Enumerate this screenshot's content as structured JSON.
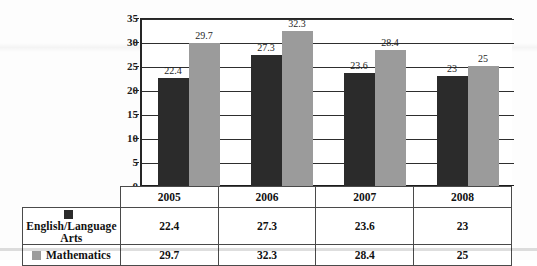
{
  "chart_data": {
    "type": "bar",
    "title": "",
    "subtitle": "",
    "xlabel": "",
    "ylabel": "",
    "categories": [
      "2005",
      "2006",
      "2007",
      "2008"
    ],
    "series": [
      {
        "name": "English/Language Arts",
        "color": "#2b2b2b",
        "values": [
          22.4,
          27.3,
          23.6,
          23
        ]
      },
      {
        "name": "Mathematics",
        "color": "#9b9b9b",
        "values": [
          29.7,
          32.3,
          28.4,
          25
        ]
      }
    ],
    "value_labels": {
      "english": [
        "22.4",
        "27.3",
        "23.6",
        "23"
      ],
      "mathematics": [
        "29.7",
        "32.3",
        "28.4",
        "25"
      ]
    },
    "ylim": [
      0,
      35
    ],
    "ytick_values": [
      0,
      5,
      10,
      15,
      20,
      25,
      30,
      35
    ],
    "ytick_labels": [
      "0",
      "5",
      "10",
      "15",
      "20",
      "25",
      "30",
      "35"
    ],
    "grid": "horizontal",
    "legend_position": "table-below",
    "annotations": []
  },
  "axis": {
    "ticks": [
      {
        "value": 35,
        "label": "35"
      },
      {
        "value": 30,
        "label": "30"
      },
      {
        "value": 25,
        "label": "25"
      },
      {
        "value": 20,
        "label": "20"
      },
      {
        "value": 15,
        "label": "15"
      },
      {
        "value": 10,
        "label": "10"
      },
      {
        "value": 5,
        "label": "5"
      },
      {
        "value": 0,
        "label": "0"
      }
    ]
  },
  "table": {
    "corner_label": "",
    "year_headers": [
      "2005",
      "2006",
      "2007",
      "2008"
    ],
    "rows": [
      {
        "label": "English/Language Arts",
        "swatch_color": "#2b2b2b",
        "swatch_name": "legend-swatch-english",
        "cells": [
          "22.4",
          "27.3",
          "23.6",
          "23"
        ]
      },
      {
        "label": "Mathematics",
        "swatch_color": "#9b9b9b",
        "swatch_name": "legend-swatch-mathematics",
        "cells": [
          "29.7",
          "32.3",
          "28.4",
          "25"
        ]
      }
    ]
  },
  "colors": {
    "series_english": "#2b2b2b",
    "series_mathematics": "#9b9b9b",
    "axis": "#262626",
    "grid": "#2e2e2e",
    "background": "#ffffff"
  }
}
